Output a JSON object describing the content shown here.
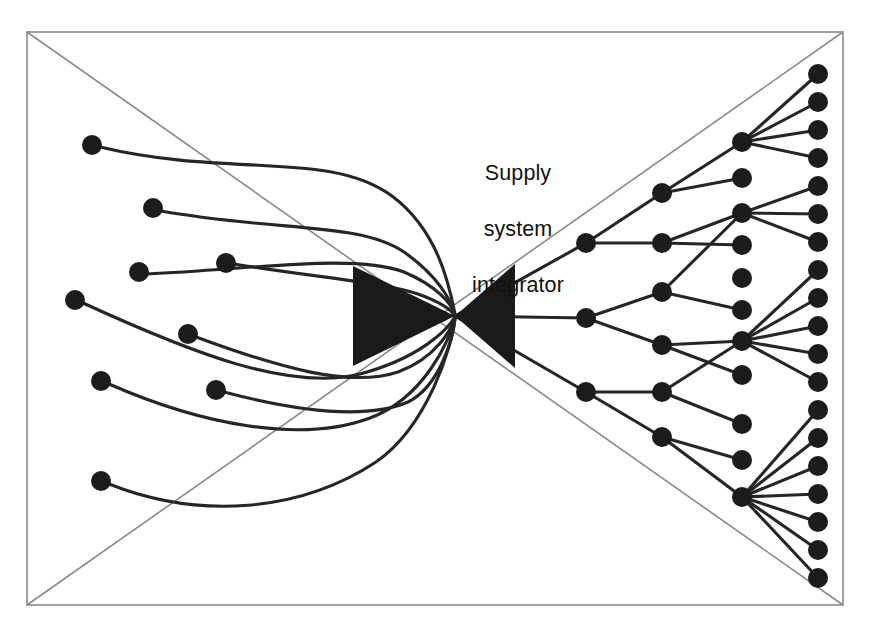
{
  "diagram": {
    "title_lines": [
      "Supply",
      "system",
      "integrator"
    ],
    "title_full": "Supply system integrator",
    "colors": {
      "frame_stroke": "#8a8a8a",
      "link_stroke": "#262626",
      "node_fill": "#1c1c1c",
      "hourglass_fill": "#1a1a1a",
      "background": "#ffffff"
    },
    "canvas": {
      "width": 869,
      "height": 628
    },
    "frame": {
      "rect": {
        "x1": 27,
        "y1": 32,
        "x2": 843,
        "y2": 605
      },
      "diagonals": [
        {
          "x1": 27,
          "y1": 32,
          "x2": 843,
          "y2": 605
        },
        {
          "x1": 27,
          "y1": 605,
          "x2": 843,
          "y2": 32
        }
      ]
    },
    "hourglass": {
      "left_triangle": [
        [
          353,
          266
        ],
        [
          353,
          366
        ],
        [
          455,
          316
        ]
      ],
      "right_triangle": [
        [
          515,
          264
        ],
        [
          515,
          368
        ],
        [
          455,
          316
        ]
      ],
      "waist": {
        "x": 455,
        "y": 316
      }
    },
    "supply_side": {
      "label": "supplier inputs",
      "node_count": 8,
      "nodes": [
        {
          "id": "s1",
          "x": 92,
          "y": 145,
          "r": 10
        },
        {
          "id": "s2",
          "x": 153,
          "y": 208,
          "r": 10
        },
        {
          "id": "s3",
          "x": 139,
          "y": 272,
          "r": 10
        },
        {
          "id": "s4",
          "x": 226,
          "y": 263,
          "r": 10
        },
        {
          "id": "s5",
          "x": 75,
          "y": 300,
          "r": 10
        },
        {
          "id": "s6",
          "x": 188,
          "y": 334,
          "r": 10
        },
        {
          "id": "s7",
          "x": 101,
          "y": 381,
          "r": 10
        },
        {
          "id": "s8",
          "x": 216,
          "y": 390,
          "r": 10
        },
        {
          "id": "s9",
          "x": 101,
          "y": 481,
          "r": 10
        }
      ],
      "links": [
        {
          "from": "s1",
          "to": "waist",
          "path": "M 100 147 C 230 178 330 150 392 196 C 440 232 450 290 455 314"
        },
        {
          "from": "s2",
          "to": "waist",
          "path": "M 161 211 C 280 232 360 222 404 252 C 438 276 451 300 455 315"
        },
        {
          "from": "s3",
          "to": "waist",
          "path": "M 147 274 C 265 268 355 254 404 272 C 437 286 452 304 455 315"
        },
        {
          "from": "s4",
          "to": "waist",
          "path": "M 234 264 C 320 278 382 282 418 294 C 443 303 452 311 455 316"
        },
        {
          "from": "s5",
          "to": "waist",
          "path": "M 83 303 C 190 352 290 392 360 374 C 420 358 447 330 455 317"
        },
        {
          "from": "s6",
          "to": "waist",
          "path": "M 196 337 C 280 368 350 388 398 372 C 436 358 452 329 455 317"
        },
        {
          "from": "s7",
          "to": "waist",
          "path": "M 109 384 C 200 424 300 444 370 418 C 424 398 450 340 455 318"
        },
        {
          "from": "s8",
          "to": "waist",
          "path": "M 224 392 C 300 412 366 420 408 402 C 440 386 453 338 455 318"
        },
        {
          "from": "s9",
          "to": "waist",
          "path": "M 109 484 C 200 520 300 512 376 462 C 428 426 452 346 455 319"
        }
      ]
    },
    "distribution_side": {
      "label": "customer network",
      "levels": [
        {
          "level": 1,
          "x": 586,
          "nodes": [
            {
              "id": "a1",
              "y": 243
            },
            {
              "id": "a2",
              "y": 318
            },
            {
              "id": "a3",
              "y": 392
            }
          ]
        },
        {
          "level": 2,
          "x": 662,
          "nodes": [
            {
              "id": "b1",
              "y": 193
            },
            {
              "id": "b2",
              "y": 243
            },
            {
              "id": "b3",
              "y": 292
            },
            {
              "id": "b4",
              "y": 345
            },
            {
              "id": "b5",
              "y": 392
            },
            {
              "id": "b6",
              "y": 437
            }
          ]
        },
        {
          "level": 3,
          "x": 742,
          "nodes": [
            {
              "id": "c1",
              "y": 142,
              "hub": true
            },
            {
              "id": "c2",
              "y": 178,
              "hub": false
            },
            {
              "id": "c3",
              "y": 213,
              "hub": true
            },
            {
              "id": "c4",
              "y": 245,
              "hub": false
            },
            {
              "id": "c5",
              "y": 278,
              "hub": false
            },
            {
              "id": "c6",
              "y": 310,
              "hub": false
            },
            {
              "id": "c7",
              "y": 341,
              "hub": true
            },
            {
              "id": "c8",
              "y": 375,
              "hub": false
            },
            {
              "id": "c9",
              "y": 424,
              "hub": false
            },
            {
              "id": "c10",
              "y": 460,
              "hub": false
            },
            {
              "id": "c11",
              "y": 497,
              "hub": true
            }
          ]
        },
        {
          "level": 4,
          "x": 818,
          "node_count": 19,
          "nodes": [
            {
              "id": "d1",
              "y": 74
            },
            {
              "id": "d2",
              "y": 102
            },
            {
              "id": "d3",
              "y": 130
            },
            {
              "id": "d4",
              "y": 158
            },
            {
              "id": "d5",
              "y": 186
            },
            {
              "id": "d6",
              "y": 214
            },
            {
              "id": "d7",
              "y": 242
            },
            {
              "id": "d8",
              "y": 270
            },
            {
              "id": "d9",
              "y": 298
            },
            {
              "id": "d10",
              "y": 326
            },
            {
              "id": "d11",
              "y": 354
            },
            {
              "id": "d12",
              "y": 382
            },
            {
              "id": "d13",
              "y": 410
            },
            {
              "id": "d14",
              "y": 438
            },
            {
              "id": "d15",
              "y": 466
            },
            {
              "id": "d16",
              "y": 494
            },
            {
              "id": "d17",
              "y": 522
            },
            {
              "id": "d18",
              "y": 550
            },
            {
              "id": "d19",
              "y": 578
            }
          ]
        }
      ],
      "edges": [
        [
          "waist",
          "a1"
        ],
        [
          "waist",
          "a2"
        ],
        [
          "waist",
          "a3"
        ],
        [
          "a1",
          "b1"
        ],
        [
          "a1",
          "b2"
        ],
        [
          "a2",
          "b3"
        ],
        [
          "a2",
          "b4"
        ],
        [
          "a3",
          "b5"
        ],
        [
          "a3",
          "b6"
        ],
        [
          "b1",
          "c1"
        ],
        [
          "b1",
          "c2"
        ],
        [
          "b2",
          "c3"
        ],
        [
          "b2",
          "c4"
        ],
        [
          "b3",
          "c3"
        ],
        [
          "b3",
          "c6"
        ],
        [
          "b4",
          "c7"
        ],
        [
          "b4",
          "c8"
        ],
        [
          "b5",
          "c7"
        ],
        [
          "b5",
          "c9"
        ],
        [
          "b6",
          "c10"
        ],
        [
          "b6",
          "c11"
        ],
        [
          "c1",
          "d1"
        ],
        [
          "c1",
          "d2"
        ],
        [
          "c1",
          "d3"
        ],
        [
          "c1",
          "d4"
        ],
        [
          "c3",
          "d5"
        ],
        [
          "c3",
          "d6"
        ],
        [
          "c3",
          "d7"
        ],
        [
          "c7",
          "d8"
        ],
        [
          "c7",
          "d9"
        ],
        [
          "c7",
          "d10"
        ],
        [
          "c7",
          "d11"
        ],
        [
          "c7",
          "d12"
        ],
        [
          "c11",
          "d13"
        ],
        [
          "c11",
          "d14"
        ],
        [
          "c11",
          "d15"
        ],
        [
          "c11",
          "d16"
        ],
        [
          "c11",
          "d17"
        ],
        [
          "c11",
          "d18"
        ],
        [
          "c11",
          "d19"
        ]
      ]
    }
  }
}
